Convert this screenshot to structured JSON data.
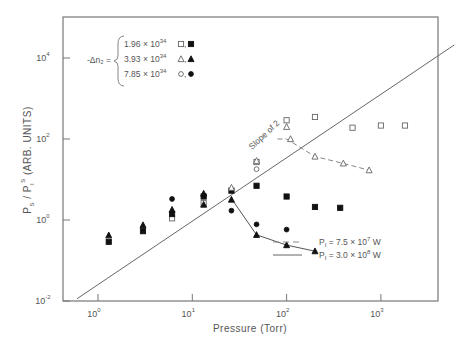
{
  "chart_data": {
    "type": "scatter",
    "title": "",
    "xlabel": "Pressure (Torr)",
    "ylabel": "P_S / P_I^S (ARB. UNITS)",
    "xscale": "log",
    "yscale": "log",
    "xlim": [
      0.45,
      22000
    ],
    "ylim": [
      0.01,
      100000
    ],
    "x_ticks": [
      {
        "label": "10",
        "exp": "0",
        "value": 1
      },
      {
        "label": "10",
        "exp": "1",
        "value": 10
      },
      {
        "label": "10",
        "exp": "2",
        "value": 100
      },
      {
        "label": "10",
        "exp": "3",
        "value": 1000
      }
    ],
    "y_ticks": [
      {
        "label": "10",
        "exp": "-2",
        "value": 0.01
      },
      {
        "label": "10",
        "exp": "0",
        "value": 1
      },
      {
        "label": "10",
        "exp": "2",
        "value": 100
      },
      {
        "label": "10",
        "exp": "4",
        "value": 10000
      }
    ],
    "grid": false,
    "legend_delta_n": {
      "prefix": "-Δn₂ =",
      "entries": [
        {
          "value": "1.96 × 10",
          "exp": "34",
          "markers": "□,■"
        },
        {
          "value": "3.93 × 10",
          "exp": "34",
          "markers": "△,▲"
        },
        {
          "value": "7.85 × 10",
          "exp": "34",
          "markers": "○,●"
        }
      ]
    },
    "legend_lines": [
      {
        "style": "dashed",
        "label": "P",
        "sub": "I",
        "rest": " = 7.5 × 10",
        "exp": "7",
        "unit": " W"
      },
      {
        "style": "solid",
        "label": "P",
        "sub": "I",
        "rest": " = 3.0 × 10",
        "exp": "8",
        "unit": " W"
      }
    ],
    "annotations": [
      {
        "text": "Slope of 2",
        "x": 110,
        "y": 250
      }
    ],
    "reference_line": {
      "label": "Slope of 2",
      "x": [
        0.6,
        6000
      ],
      "y": [
        0.0114,
        21000
      ]
    },
    "series": [
      {
        "name": "Δn=1.96e34, P=7.5e7 W",
        "marker": "open-square",
        "points": [
          [
            6.1,
            1.1
          ],
          [
            13.2,
            2.6
          ],
          [
            48,
            27
          ],
          [
            100,
            290
          ],
          [
            200,
            350
          ],
          [
            500,
            190
          ],
          [
            1000,
            215
          ],
          [
            1800,
            215
          ]
        ]
      },
      {
        "name": "Δn=1.96e34, P=3.0e8 W",
        "marker": "filled-square",
        "points": [
          [
            1.3,
            0.29
          ],
          [
            3,
            0.53
          ],
          [
            6.1,
            1.4
          ],
          [
            13.2,
            3.8
          ],
          [
            26,
            5.3
          ],
          [
            48,
            7
          ],
          [
            100,
            3.8
          ],
          [
            200,
            2.1
          ],
          [
            370,
            2
          ]
        ]
      },
      {
        "name": "Δn=3.93e34, P=7.5e7 W",
        "marker": "open-triangle",
        "points": [
          [
            26,
            6.3
          ],
          [
            48,
            29
          ],
          [
            100,
            200
          ],
          [
            110,
            100
          ],
          [
            200,
            37
          ],
          [
            400,
            25
          ],
          [
            750,
            17
          ]
        ]
      },
      {
        "name": "Δn=3.93e34, P=3.0e8 W",
        "marker": "filled-triangle",
        "points": [
          [
            1.3,
            0.42
          ],
          [
            3,
            0.75
          ],
          [
            6.1,
            1.8
          ],
          [
            13.2,
            4.5
          ],
          [
            13.2,
            2.4
          ],
          [
            26,
            3.2
          ],
          [
            48,
            0.43
          ],
          [
            100,
            0.24
          ],
          [
            200,
            0.17
          ]
        ]
      },
      {
        "name": "Δn=7.85e34, P=7.5e7 W",
        "marker": "open-circle",
        "points": [
          [
            48,
            18
          ]
        ]
      },
      {
        "name": "Δn=7.85e34, P=3.0e8 W",
        "marker": "filled-circle",
        "points": [
          [
            6.1,
            3.3
          ],
          [
            26,
            1.7
          ],
          [
            48,
            0.78
          ],
          [
            100,
            0.58
          ]
        ]
      }
    ],
    "curves": [
      {
        "style": "dashed",
        "points": [
          [
            80,
            100
          ],
          [
            100,
            100
          ],
          [
            200,
            37
          ],
          [
            400,
            25
          ],
          [
            750,
            17
          ]
        ]
      },
      {
        "style": "solid",
        "points": [
          [
            26,
            3.4
          ],
          [
            48,
            0.43
          ],
          [
            100,
            0.24
          ],
          [
            200,
            0.17
          ]
        ]
      }
    ]
  }
}
